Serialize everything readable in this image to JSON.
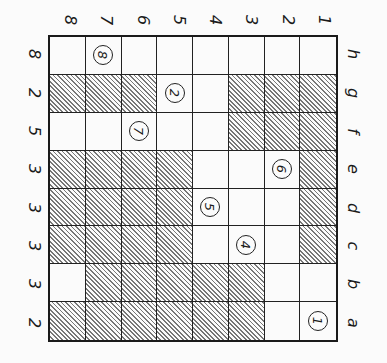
{
  "diagram": {
    "type": "chessboard-style grid (rotated 90°)",
    "top_labels": [
      "8",
      "7",
      "6",
      "5",
      "4",
      "3",
      "2",
      "1"
    ],
    "left_labels": [
      "8",
      "2",
      "5",
      "3",
      "3",
      "3",
      "3",
      "2"
    ],
    "right_labels": [
      "h",
      "g",
      "f",
      "e",
      "d",
      "c",
      "b",
      "a"
    ],
    "hatch_color": "#777777",
    "rows": [
      {
        "label": "h",
        "cells": [
          "W",
          "8",
          "W",
          "W",
          "W",
          "W",
          "W",
          "W"
        ]
      },
      {
        "label": "g",
        "cells": [
          "H",
          "H",
          "H",
          "2",
          "W",
          "H",
          "H",
          "H"
        ]
      },
      {
        "label": "f",
        "cells": [
          "W",
          "W",
          "7",
          "W",
          "W",
          "H",
          "H",
          "H"
        ]
      },
      {
        "label": "e",
        "cells": [
          "H",
          "H",
          "H",
          "H",
          "W",
          "W",
          "6",
          "H"
        ]
      },
      {
        "label": "d",
        "cells": [
          "H",
          "H",
          "H",
          "H",
          "5",
          "W",
          "W",
          "H"
        ]
      },
      {
        "label": "c",
        "cells": [
          "H",
          "H",
          "H",
          "H",
          "W",
          "4",
          "W",
          "H"
        ]
      },
      {
        "label": "b",
        "cells": [
          "W",
          "H",
          "H",
          "H",
          "H",
          "H",
          "W",
          "W"
        ]
      },
      {
        "label": "a",
        "cells": [
          "H",
          "H",
          "H",
          "H",
          "H",
          "H",
          "W",
          "1"
        ]
      }
    ],
    "legend": {
      "H": "hatched square",
      "W": "empty square",
      "digits": "circled numbered marker"
    }
  }
}
